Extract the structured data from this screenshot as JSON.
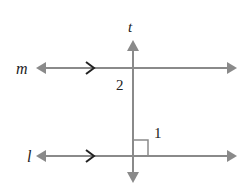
{
  "diagram": {
    "type": "geometry",
    "colors": {
      "line": "#8a8a8a",
      "text": "#222222",
      "background": "#ffffff"
    },
    "labels": {
      "line_t": "t",
      "line_m": "m",
      "line_l": "l",
      "angle_1": "1",
      "angle_2": "2"
    }
  }
}
